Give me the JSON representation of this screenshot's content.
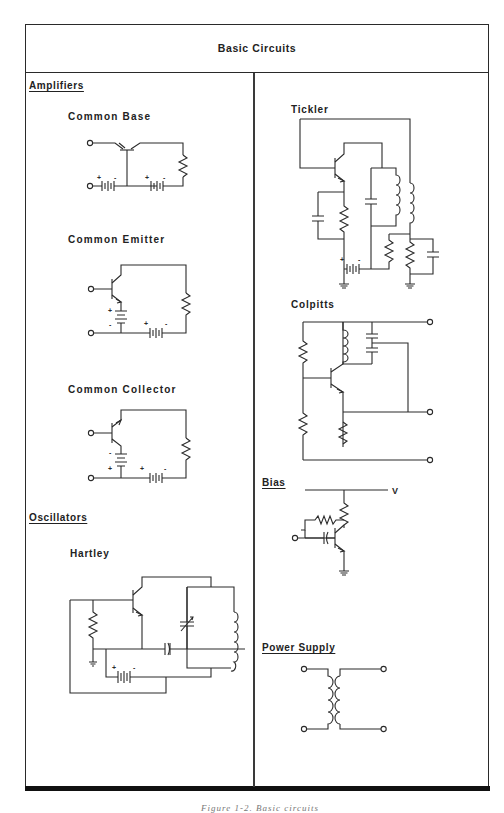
{
  "figure": {
    "title": "Basic Circuits",
    "caption_partial": "Figure 1-2. Basic circuits"
  },
  "left_column": {
    "sections": [
      {
        "heading": "Amplifiers",
        "circuits": [
          {
            "name": "Common Base",
            "components": [
              "transistor",
              "battery +/-",
              "battery +/-",
              "resistor",
              "input terminal",
              "output terminal"
            ]
          },
          {
            "name": "Common Emitter",
            "components": [
              "transistor",
              "battery +/-",
              "battery +/-",
              "resistor",
              "input terminal",
              "output terminal"
            ]
          },
          {
            "name": "Common Collector",
            "components": [
              "transistor",
              "battery -/+",
              "battery +/-",
              "resistor",
              "input terminal",
              "output terminal"
            ]
          }
        ]
      },
      {
        "heading": "Oscillators",
        "circuits": [
          {
            "name": "Hartley",
            "components": [
              "transistor",
              "resistor",
              "ground",
              "capacitor",
              "variable capacitor",
              "tapped inductor",
              "battery +/-"
            ]
          }
        ]
      }
    ]
  },
  "right_column": {
    "circuits": [
      {
        "name": "Tickler",
        "underlined": false,
        "components": [
          "transistor",
          "capacitor",
          "resistor",
          "capacitor",
          "inductor",
          "tickler coil",
          "resistor",
          "resistor",
          "capacitor",
          "battery +/-",
          "ground",
          "ground"
        ]
      },
      {
        "name": "Colpitts",
        "underlined": false,
        "components": [
          "transistor",
          "resistor",
          "resistor",
          "inductor",
          "capacitor",
          "capacitor",
          "resistor",
          "output terminals x3"
        ]
      },
      {
        "name": "Bias",
        "underlined": true,
        "supply_label": "V",
        "components": [
          "transistor",
          "resistor",
          "feedback resistor",
          "coupling capacitor",
          "input terminal",
          "ground"
        ]
      },
      {
        "name": "Power Supply",
        "underlined": true,
        "components": [
          "transformer",
          "terminals x4"
        ]
      }
    ]
  },
  "symbols": {
    "plus": "+",
    "minus": "-"
  },
  "colors": {
    "ink": "#2a2a2a",
    "background": "#ffffff",
    "border": "#111111"
  }
}
